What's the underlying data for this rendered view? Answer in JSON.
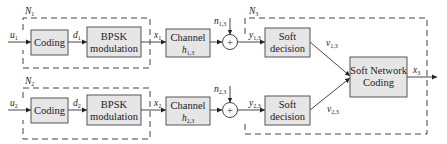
{
  "diagram": {
    "groups": [
      {
        "id": "N1",
        "label": "N",
        "sub": "1"
      },
      {
        "id": "N2",
        "label": "N",
        "sub": "2"
      },
      {
        "id": "N3",
        "label": "N",
        "sub": "3"
      }
    ],
    "row1": {
      "input": {
        "label": "u",
        "sub": "1"
      },
      "coding": "Coding",
      "coded": {
        "label": "d",
        "sub": "1"
      },
      "bpsk_line1": "BPSK",
      "bpsk_line2": "modulation",
      "tx": {
        "label": "x",
        "sub": "1"
      },
      "channel_line1": "Channel",
      "channel_gain": {
        "label": "h",
        "sub": "1,3"
      },
      "noise": {
        "label": "n",
        "sub": "1,3"
      },
      "adder_symbol": "+",
      "rx": {
        "label": "y",
        "sub": "1,3"
      },
      "soft_line1": "Soft",
      "soft_line2": "decision",
      "soft_out": {
        "label": "v",
        "sub": "1,3"
      }
    },
    "row2": {
      "input": {
        "label": "u",
        "sub": "2"
      },
      "coding": "Coding",
      "coded": {
        "label": "d",
        "sub": "2"
      },
      "bpsk_line1": "BPSK",
      "bpsk_line2": "modulation",
      "tx": {
        "label": "x",
        "sub": "2"
      },
      "channel_line1": "Channel",
      "channel_gain": {
        "label": "h",
        "sub": "2,3"
      },
      "noise": {
        "label": "n",
        "sub": "2,3"
      },
      "adder_symbol": "+",
      "rx": {
        "label": "y",
        "sub": "2,3"
      },
      "soft_line1": "Soft",
      "soft_line2": "decision",
      "soft_out": {
        "label": "v",
        "sub": "2,3"
      }
    },
    "snc": {
      "line1": "Soft Network",
      "line2": "Coding",
      "output": {
        "label": "x",
        "sub": "3"
      }
    },
    "colors": {
      "block_fill": "#e6e6e6",
      "block_stroke": "#555555",
      "line": "#333333"
    }
  }
}
